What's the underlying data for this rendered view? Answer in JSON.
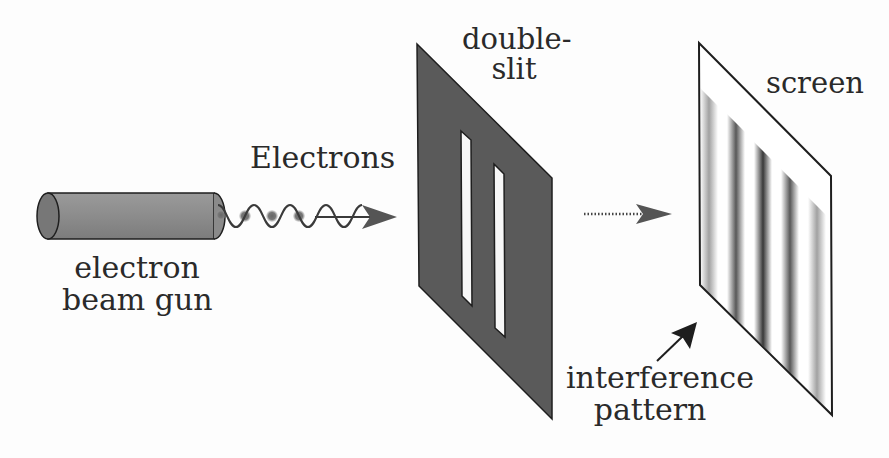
{
  "diagram": {
    "labels": {
      "electrons": "Electrons",
      "gun_line1": "electron",
      "gun_line2": "beam gun",
      "slit_line1": "double-",
      "slit_line2": "slit",
      "screen": "screen",
      "pattern_line1": "interference",
      "pattern_line2": "pattern"
    },
    "components": [
      {
        "id": "electron-beam-gun",
        "shape": "cylinder"
      },
      {
        "id": "electron-wave",
        "shape": "sine-wave-with-particles",
        "particles": 3
      },
      {
        "id": "double-slit-plate",
        "shape": "parallelogram",
        "slits": 2
      },
      {
        "id": "propagation-arrow",
        "shape": "dotted-arrow"
      },
      {
        "id": "screen",
        "shape": "parallelogram",
        "fringes": 5
      },
      {
        "id": "pattern-pointer",
        "shape": "arrow"
      }
    ],
    "colors": {
      "plate": "#5a5a5a",
      "outline": "#1e1e1e",
      "gun_body": "#8a8a8a",
      "gun_cap": "#777777",
      "wave": "#3a3a3a",
      "particle": "#707070",
      "arrow": "#555555",
      "screen_bg": "#ffffff",
      "fringe_dark": "#2e2e2e"
    },
    "fringe_opacity": [
      0.45,
      0.8,
      0.95,
      0.8,
      0.45
    ]
  }
}
